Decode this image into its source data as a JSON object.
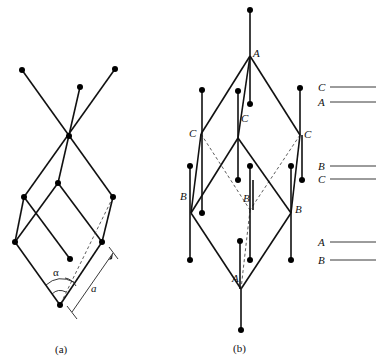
{
  "panel_a": {
    "caption": "(a)",
    "angle_label": "α",
    "length_label": "a"
  },
  "panel_b": {
    "caption": "(b)",
    "vertex_labels": {
      "top": "A",
      "upper_left": "C",
      "upper_center": "C",
      "upper_right": "C",
      "lower_left": "B",
      "lower_center": "B",
      "lower_right": "B",
      "bottom": "A"
    }
  },
  "stacking_legend": [
    {
      "label": "C"
    },
    {
      "label": "A"
    },
    {
      "label": "B"
    },
    {
      "label": "C"
    },
    {
      "label": "A"
    },
    {
      "label": "B"
    }
  ]
}
